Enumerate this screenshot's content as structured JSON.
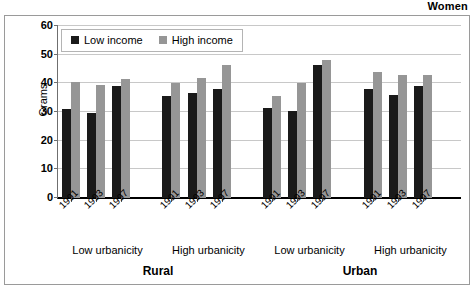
{
  "figure": {
    "sex_title": "Women",
    "ylabel": "Grams"
  },
  "legend": {
    "entries": [
      {
        "label": "Low income",
        "color": "#1a1a1a",
        "icon": "square-swatch-icon"
      },
      {
        "label": "High income",
        "color": "#969696",
        "icon": "square-swatch-icon"
      }
    ]
  },
  "chart_data": {
    "type": "bar",
    "title": "Women",
    "xlabel": "",
    "ylabel": "Grams",
    "ylim": [
      0,
      60
    ],
    "yticks": [
      0,
      10,
      20,
      30,
      40,
      50,
      60
    ],
    "grid": true,
    "legend_position": "upper-left-inside",
    "grouping": [
      "residence",
      "urbanicity",
      "year"
    ],
    "residence_groups": [
      "Rural",
      "Urban"
    ],
    "urbanicity_groups": [
      "Low urbanicity",
      "High urbanicity",
      "Low urbanicity",
      "High urbanicity"
    ],
    "categories": [
      "1991",
      "1993",
      "1997"
    ],
    "series": [
      {
        "name": "Low income",
        "color": "#1a1a1a"
      },
      {
        "name": "High income",
        "color": "#969696"
      }
    ],
    "groups": [
      {
        "residence": "Rural",
        "urbanicity": "Low urbanicity",
        "years": [
          {
            "year": "1991",
            "low_income": 31.0,
            "high_income": 40.5
          },
          {
            "year": "1993",
            "low_income": 29.5,
            "high_income": 39.5
          },
          {
            "year": "1997",
            "low_income": 39.0,
            "high_income": 41.5
          }
        ]
      },
      {
        "residence": "Rural",
        "urbanicity": "High urbanicity",
        "years": [
          {
            "year": "1991",
            "low_income": 35.5,
            "high_income": 40.0
          },
          {
            "year": "1993",
            "low_income": 36.5,
            "high_income": 42.0
          },
          {
            "year": "1997",
            "low_income": 38.0,
            "high_income": 46.5
          }
        ]
      },
      {
        "residence": "Urban",
        "urbanicity": "Low urbanicity",
        "years": [
          {
            "year": "1991",
            "low_income": 31.5,
            "high_income": 35.5
          },
          {
            "year": "1993",
            "low_income": 30.5,
            "high_income": 40.0
          },
          {
            "year": "1997",
            "low_income": 46.5,
            "high_income": 48.0
          }
        ]
      },
      {
        "residence": "Urban",
        "urbanicity": "High urbanicity",
        "years": [
          {
            "year": "1991",
            "low_income": 38.0,
            "high_income": 44.0
          },
          {
            "year": "1993",
            "low_income": 36.0,
            "high_income": 43.0
          },
          {
            "year": "1997",
            "low_income": 39.0,
            "high_income": 43.0
          }
        ]
      }
    ]
  }
}
